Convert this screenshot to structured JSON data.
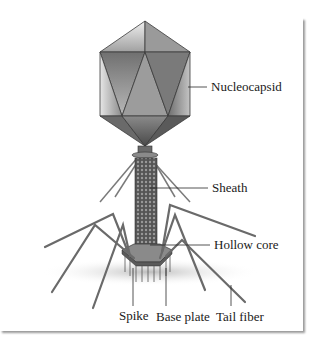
{
  "figure": {
    "labels": {
      "nucleocapsid": "Nucleocapsid",
      "sheath": "Sheath",
      "hollow_core": "Hollow core",
      "spike": "Spike",
      "base_plate": "Base plate",
      "tail_fiber": "Tail fiber"
    },
    "colors": {
      "capsid_light": "#d8d8d8",
      "capsid_dark": "#5e5e5e",
      "line": "#3a3a3a",
      "text": "#1a1a1a",
      "frame_shadow": "#9a9a9a"
    }
  }
}
